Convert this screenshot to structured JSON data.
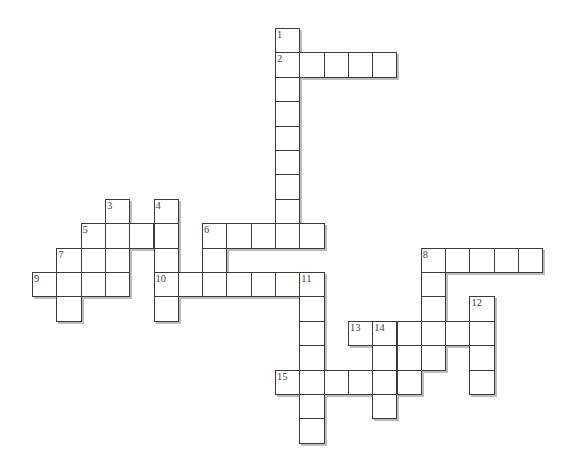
{
  "puzzle": {
    "type": "crossword",
    "origin": {
      "x": 32,
      "y": 28
    },
    "cell_size": 24.3,
    "colors": {
      "border": "#3a3a3a",
      "shadow": "#bdbdbd",
      "number": "#444444",
      "fill": "#ffffff"
    },
    "clue_numbers": [
      {
        "n": "1",
        "row": 0,
        "col": 10
      },
      {
        "n": "2",
        "row": 1,
        "col": 10
      },
      {
        "n": "3",
        "row": 7,
        "col": 3
      },
      {
        "n": "4",
        "row": 7,
        "col": 5
      },
      {
        "n": "5",
        "row": 8,
        "col": 2
      },
      {
        "n": "6",
        "row": 8,
        "col": 7
      },
      {
        "n": "7",
        "row": 9,
        "col": 1
      },
      {
        "n": "8",
        "row": 9,
        "col": 16
      },
      {
        "n": "9",
        "row": 10,
        "col": 0
      },
      {
        "n": "10",
        "row": 10,
        "col": 5
      },
      {
        "n": "11",
        "row": 10,
        "col": 11
      },
      {
        "n": "12",
        "row": 11,
        "col": 18
      },
      {
        "n": "13",
        "row": 12,
        "col": 13
      },
      {
        "n": "14",
        "row": 12,
        "col": 14
      },
      {
        "n": "15",
        "row": 14,
        "col": 10
      }
    ],
    "words": [
      {
        "n": "1",
        "dir": "down",
        "row": 0,
        "col": 10,
        "len": 9
      },
      {
        "n": "2",
        "dir": "across",
        "row": 1,
        "col": 10,
        "len": 5
      },
      {
        "n": "3",
        "dir": "down",
        "row": 7,
        "col": 3,
        "len": 4
      },
      {
        "n": "4",
        "dir": "down",
        "row": 7,
        "col": 5,
        "len": 5
      },
      {
        "n": "5",
        "dir": "across",
        "row": 8,
        "col": 2,
        "len": 4
      },
      {
        "n": "6",
        "dir": "across",
        "row": 8,
        "col": 7,
        "len": 5
      },
      {
        "n": "6",
        "dir": "down",
        "row": 8,
        "col": 7,
        "len": 3
      },
      {
        "n": "7",
        "dir": "down",
        "row": 9,
        "col": 1,
        "len": 3
      },
      {
        "n": "7",
        "dir": "across",
        "row": 9,
        "col": 1,
        "len": 3
      },
      {
        "n": "8",
        "dir": "across",
        "row": 9,
        "col": 16,
        "len": 5
      },
      {
        "n": "8",
        "dir": "down",
        "row": 9,
        "col": 16,
        "len": 5
      },
      {
        "n": "9",
        "dir": "across",
        "row": 10,
        "col": 0,
        "len": 4
      },
      {
        "n": "10",
        "dir": "across",
        "row": 10,
        "col": 5,
        "len": 7
      },
      {
        "n": "11",
        "dir": "down",
        "row": 10,
        "col": 11,
        "len": 7
      },
      {
        "n": "12",
        "dir": "down",
        "row": 11,
        "col": 18,
        "len": 4
      },
      {
        "n": "13",
        "dir": "across",
        "row": 12,
        "col": 13,
        "len": 6
      },
      {
        "n": "14",
        "dir": "down",
        "row": 12,
        "col": 14,
        "len": 4
      },
      {
        "n": "x",
        "dir": "across",
        "row": 13,
        "col": 14,
        "len": 3
      },
      {
        "n": "15",
        "dir": "across",
        "row": 14,
        "col": 10,
        "len": 6
      }
    ]
  }
}
